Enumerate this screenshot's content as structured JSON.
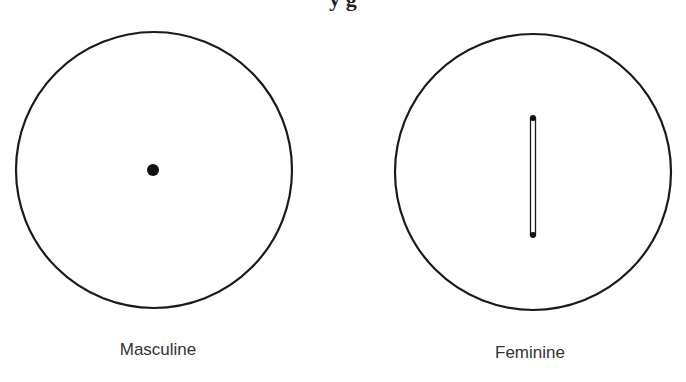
{
  "title_fragment": "y     g",
  "colors": {
    "stroke": "#1a1a1a",
    "text": "#333333",
    "background": "#ffffff"
  },
  "symbols": [
    {
      "id": "masculine",
      "label": "Masculine",
      "circle": {
        "cx": 154,
        "cy": 170,
        "r": 138
      },
      "mark": {
        "type": "dot",
        "cx": 153,
        "cy": 170,
        "r": 6
      }
    },
    {
      "id": "feminine",
      "label": "Feminine",
      "circle": {
        "cx": 533,
        "cy": 172,
        "r": 138
      },
      "mark": {
        "type": "slot",
        "x": 533,
        "y1": 118,
        "y2": 235,
        "width": 5,
        "end_dot_r": 3
      }
    }
  ]
}
